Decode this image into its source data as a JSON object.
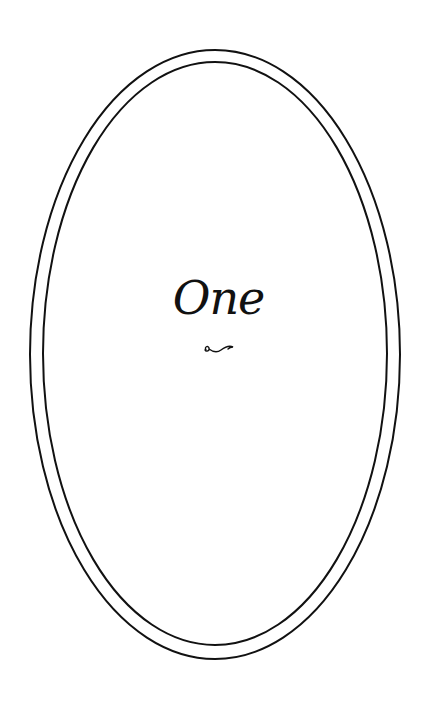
{
  "page": {
    "chapter_title": "One",
    "ornament_icon": "swash-flourish-icon",
    "frame": "double-oval-border"
  },
  "colors": {
    "ink": "#111111",
    "background": "#ffffff"
  }
}
